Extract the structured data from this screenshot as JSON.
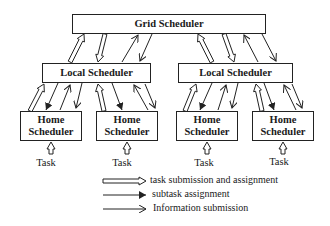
{
  "diagram": {
    "grid_scheduler": "Grid Scheduler",
    "local_schedulers": [
      "Local Scheduler",
      "Local Scheduler"
    ],
    "home_schedulers": [
      {
        "line1": "Home",
        "line2": "Scheduler"
      },
      {
        "line1": "Home",
        "line2": "Scheduler"
      },
      {
        "line1": "Home",
        "line2": "Scheduler"
      },
      {
        "line1": "Home",
        "line2": "Scheduler"
      }
    ],
    "task_labels": [
      "Task",
      "Task",
      "Task",
      "Task"
    ]
  },
  "legend": [
    {
      "style": "hollow-double-arrow",
      "label": "task submission and assignment"
    },
    {
      "style": "filled-arrow",
      "label": "subtask assignment"
    },
    {
      "style": "open-arrow",
      "label": "Information submission"
    }
  ],
  "colors": {
    "line": "#222222",
    "background": "#ffffff"
  }
}
